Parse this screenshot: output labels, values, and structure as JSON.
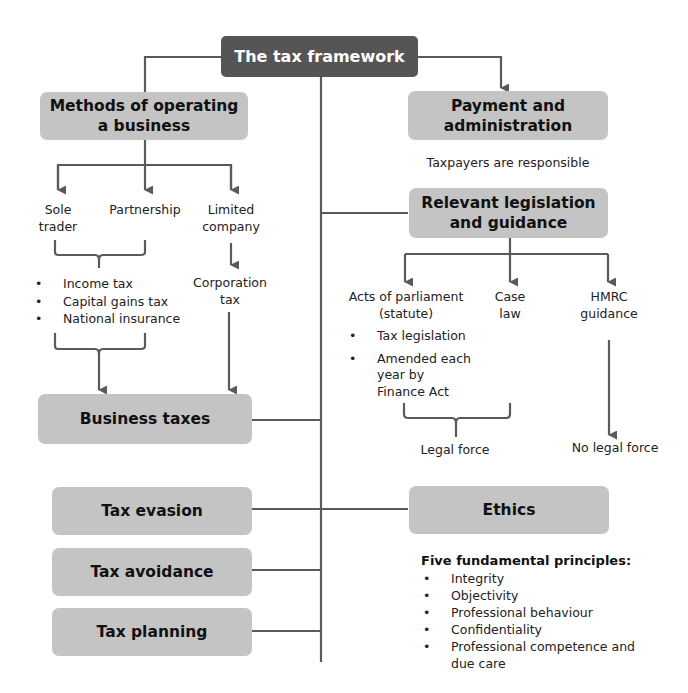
{
  "title": "The tax framework",
  "left": {
    "methods_box": "Methods of operating a business",
    "methods_lines": [
      "Methods of operating",
      "a business"
    ],
    "entities": [
      {
        "lines": [
          "Sole",
          "trader"
        ]
      },
      {
        "lines": [
          "Partnership"
        ]
      },
      {
        "lines": [
          "Limited",
          "company"
        ]
      }
    ],
    "individual_taxes": [
      "Income tax",
      "Capital gains tax",
      "National insurance"
    ],
    "company_tax_lines": [
      "Corporation",
      "tax"
    ],
    "business_taxes_box": "Business taxes",
    "tax_evasion_box": "Tax evasion",
    "tax_avoidance_box": "Tax avoidance",
    "tax_planning_box": "Tax planning"
  },
  "right": {
    "payment_lines": [
      "Payment and",
      "administration"
    ],
    "payment_note": "Taxpayers are responsible",
    "legislation_lines": [
      "Relevant legislation",
      "and guidance"
    ],
    "sources": [
      {
        "lines": [
          "Acts of parliament",
          "(statute)"
        ]
      },
      {
        "lines": [
          "Case",
          "law"
        ]
      },
      {
        "lines": [
          "HMRC",
          "guidance"
        ]
      }
    ],
    "statute_points": [
      "Tax legislation",
      "Amended each year by Finance Act"
    ],
    "statute_points_lines": [
      [
        "Tax legislation"
      ],
      [
        "Amended each",
        "year by",
        "Finance Act"
      ]
    ],
    "legal_force": "Legal force",
    "no_legal_force": "No legal force",
    "ethics_box": "Ethics",
    "principles_heading": "Five fundamental principles:",
    "principles": [
      "Integrity",
      "Objectivity",
      "Professional behaviour",
      "Confidentiality",
      "Professional competence and due care"
    ],
    "principles_last_lines": [
      "Professional competence and",
      "due care"
    ]
  },
  "colors": {
    "title_box": "#555555",
    "node_box": "#c4c4c4",
    "connector": "#5a5a5a",
    "background": "#ffffff"
  }
}
